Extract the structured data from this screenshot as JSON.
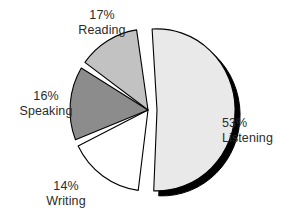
{
  "chart_data": {
    "type": "pie",
    "title": "",
    "subtitle": "",
    "xlabel": "",
    "ylabel": "",
    "legend_position": "none",
    "grid": false,
    "labels_inline": true,
    "categories": [
      "Listening",
      "Reading",
      "Speaking",
      "Writing"
    ],
    "values": [
      53,
      17,
      16,
      14
    ],
    "unit": "%",
    "slices": [
      {
        "name": "Listening",
        "value": 53,
        "percent_label": "53%",
        "color": "#e9e9e9",
        "exploded": true,
        "shadow": true
      },
      {
        "name": "Reading",
        "value": 17,
        "percent_label": "17%",
        "color": "#ffffff",
        "exploded": false,
        "shadow": false
      },
      {
        "name": "Speaking",
        "value": 16,
        "percent_label": "16%",
        "color": "#8c8c8c",
        "exploded": false,
        "shadow": false
      },
      {
        "name": "Writing",
        "value": 14,
        "percent_label": "14%",
        "color": "#c2c2c2",
        "exploded": false,
        "shadow": false
      }
    ]
  },
  "labels": {
    "reading": {
      "percent": "17%",
      "name": "Reading"
    },
    "speaking": {
      "percent": "16%",
      "name": "Speaking"
    },
    "writing": {
      "percent": "14%",
      "name": "Writing"
    },
    "listening": {
      "percent": "53%",
      "name": "Listening"
    }
  },
  "colors": {
    "background": "#ffffff",
    "text": "#2b2b2b",
    "outline": "#000000",
    "listening": "#e9e9e9",
    "reading": "#ffffff",
    "speaking": "#8c8c8c",
    "writing": "#c2c2c2"
  }
}
